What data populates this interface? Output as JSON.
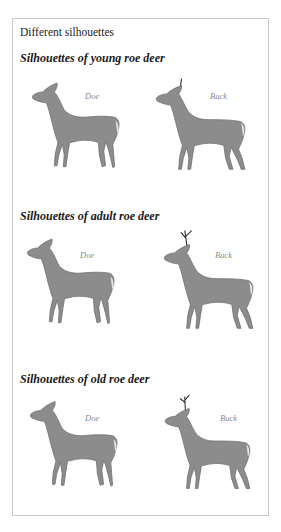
{
  "page": {
    "title": "Different silhouettes",
    "sections": [
      {
        "heading": "Silhouettes of young roe deer",
        "doe_label": "Doe",
        "buck_label": "Buck"
      },
      {
        "heading": "Silhouettes of adult roe deer",
        "doe_label": "Doe",
        "buck_label": "Buck"
      },
      {
        "heading": "Silhouettes of old roe deer",
        "doe_label": "Doe",
        "buck_label": "Buck"
      }
    ]
  },
  "colors": {
    "silhouette": "#8c8c8c",
    "antler": "#3a3a3a",
    "frame_border": "#c9c9c9",
    "label_text": "#8a8a8a"
  }
}
